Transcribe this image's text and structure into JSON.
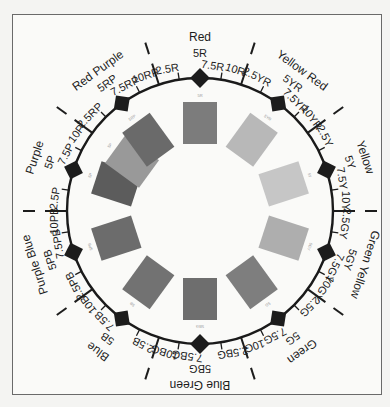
{
  "geometry": {
    "cx": 200,
    "cy": 211,
    "ring_r": 133
  },
  "hue_families": [
    {
      "key": "R",
      "name": "Red",
      "angle": 0,
      "labels": [
        "2.5R",
        "5R",
        "7.5R",
        "10R"
      ]
    },
    {
      "key": "YR",
      "name": "Yellow Red",
      "angle": 36,
      "labels": [
        "2.5YR",
        "5YR",
        "7.5YR",
        "10YR"
      ]
    },
    {
      "key": "Y",
      "name": "Yellow",
      "angle": 72,
      "labels": [
        "2.5Y",
        "5Y",
        "7.5Y",
        "10Y"
      ]
    },
    {
      "key": "GY",
      "name": "Green Yellow",
      "angle": 108,
      "labels": [
        "2.5GY",
        "5GY",
        "7.5GY",
        "10GY"
      ]
    },
    {
      "key": "G",
      "name": "Green",
      "angle": 144,
      "labels": [
        "2.5G",
        "5G",
        "7.5G",
        "10G"
      ]
    },
    {
      "key": "BG",
      "name": "Blue Green",
      "angle": 180,
      "labels": [
        "2.5BG",
        "5BG",
        "7.5BG",
        "10BG"
      ]
    },
    {
      "key": "B",
      "name": "Blue",
      "angle": 216,
      "labels": [
        "2.5B",
        "5B",
        "7.5B",
        "10B"
      ]
    },
    {
      "key": "PB",
      "name": "Purple Blue",
      "angle": 252,
      "labels": [
        "2.5PB",
        "5PB",
        "7.5PB",
        "10PB"
      ]
    },
    {
      "key": "P",
      "name": "Purple",
      "angle": 288,
      "labels": [
        "2.5P",
        "5P",
        "7.5P",
        "10P"
      ]
    },
    {
      "key": "RP",
      "name": "Red Purple",
      "angle": 324,
      "labels": [
        "2.5RP",
        "5RP",
        "7.5RP",
        "10RP"
      ]
    }
  ],
  "patches": [
    {
      "hue": "5R",
      "angle": 0,
      "gray": "#7c7c7c"
    },
    {
      "hue": "5YR",
      "angle": 36,
      "gray": "#b8b8b8"
    },
    {
      "hue": "5Y",
      "angle": 72,
      "gray": "#c6c6c6"
    },
    {
      "hue": "5GY",
      "angle": 108,
      "gray": "#aeaeae"
    },
    {
      "hue": "5G",
      "angle": 144,
      "gray": "#7e7e7e"
    },
    {
      "hue": "5BG",
      "angle": 180,
      "gray": "#6e6e6e"
    },
    {
      "hue": "5B",
      "angle": 216,
      "gray": "#727272"
    },
    {
      "hue": "5PB",
      "angle": 252,
      "gray": "#6c6c6c"
    },
    {
      "hue": "5P",
      "angle": 288,
      "gray": "#5c5c5c"
    },
    {
      "hue": "5P2",
      "angle": 306,
      "gray": "#999999"
    },
    {
      "hue": "5RP",
      "angle": 324,
      "gray": "#6a6a6a"
    }
  ],
  "colors": {
    "ink": "#1c1c1c",
    "ring": "#1a1a1a",
    "paper": "#fafaf8",
    "frame": "#6a6a6a"
  }
}
